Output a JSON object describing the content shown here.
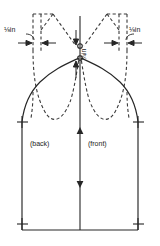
{
  "diagram": {
    "type": "sewing-pattern-schematic",
    "colors": {
      "line": "#262626",
      "dashed": "#3a3a3a",
      "text": "#1a1a1a",
      "background": "#ffffff"
    },
    "labels": {
      "seam_left": "⅛in",
      "seam_left_numerator": "5",
      "seam_left_denominator": "8",
      "seam_left_unit": "in",
      "seam_right": "⅛in",
      "seam_right_numerator": "5",
      "seam_right_denominator": "8",
      "seam_right_unit": "in",
      "cap_height_numerator": "3",
      "cap_height_denominator": "4",
      "cap_height_unit": "in",
      "cap_height": "¾in",
      "back": "(back)",
      "front": "(front)"
    },
    "markers": {
      "grainline": "double-headed-arrow",
      "corner_marks": "cross",
      "notch_marks": "cross",
      "measure_arrows": "inward-pointing-arrows"
    },
    "line_styles": {
      "original_pattern": "solid",
      "adjusted_pattern": "dashed"
    }
  }
}
